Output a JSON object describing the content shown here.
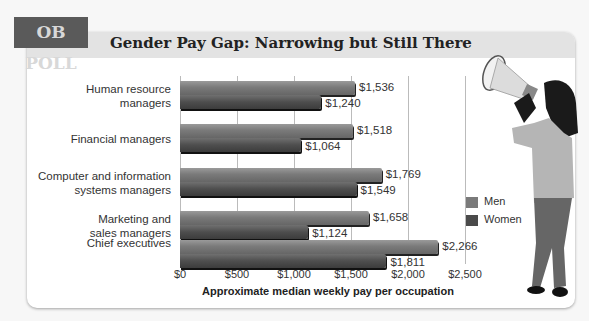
{
  "badge": "OB POLL",
  "title": "Gender Pay Gap: Narrowing but Still There",
  "chart_data": {
    "type": "bar",
    "orientation": "horizontal",
    "title": "Gender Pay Gap: Narrowing but Still There",
    "xlabel": "Approximate median weekly pay per occupation",
    "ylabel": "",
    "xlim": [
      0,
      2500
    ],
    "x_ticks": [
      "$0",
      "$500",
      "$1,000",
      "$1,500",
      "$2,000",
      "$2,500"
    ],
    "grid": true,
    "legend_position": "right",
    "categories": [
      "Human resource managers",
      "Financial managers",
      "Computer and information systems managers",
      "Marketing and sales managers",
      "Chief executives"
    ],
    "series": [
      {
        "name": "Men",
        "color": "#7a7a7a",
        "values": [
          1536,
          1518,
          1769,
          1658,
          2266
        ],
        "labels": [
          "$1,536",
          "$1,518",
          "$1,769",
          "$1,658",
          "$2,266"
        ]
      },
      {
        "name": "Women",
        "color": "#4a4a4a",
        "values": [
          1240,
          1064,
          1549,
          1124,
          1811
        ],
        "labels": [
          "$1,240",
          "$1,064",
          "$1,549",
          "$1,124",
          "$1,811"
        ]
      }
    ]
  },
  "category_lines": [
    [
      "Human resource",
      "managers"
    ],
    [
      "Financial managers"
    ],
    [
      "Computer and information",
      "systems managers"
    ],
    [
      "Marketing and",
      "sales managers"
    ],
    [
      "Chief executives"
    ]
  ],
  "legend": {
    "men": "Men",
    "women": "Women"
  },
  "illustration": "woman-with-megaphone"
}
